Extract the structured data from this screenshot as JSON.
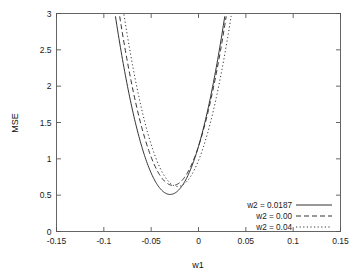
{
  "chart_data": {
    "type": "line",
    "title": "",
    "xlabel": "w1",
    "ylabel": "MSE",
    "xlim": [
      -0.15,
      0.15
    ],
    "ylim": [
      0,
      3
    ],
    "grid": false,
    "legend_position": "lower-right",
    "xticks": [
      "-0.15",
      "-0.1",
      "-0.05",
      "0",
      "0.05",
      "0.1",
      "0.15"
    ],
    "xtick_values": [
      -0.15,
      -0.1,
      -0.05,
      0,
      0.05,
      0.1,
      0.15
    ],
    "yticks": [
      "0",
      "0.5",
      "1",
      "1.5",
      "2",
      "2.5",
      "3"
    ],
    "ytick_values": [
      0,
      0.5,
      1,
      1.5,
      2,
      2.5,
      3
    ],
    "series": [
      {
        "name": "w2 = 0.0187",
        "style": "solid",
        "vertex_x": -0.03,
        "vertex_y": 0.51,
        "curvature": 735,
        "x": [
          -0.122,
          -0.11,
          -0.1,
          -0.09,
          -0.08,
          -0.07,
          -0.06,
          -0.05,
          -0.04,
          -0.03,
          -0.02,
          -0.01,
          0.0,
          0.01,
          0.02,
          0.03,
          0.04,
          0.05,
          0.058
        ],
        "y": [
          3.0,
          2.49,
          2.1,
          1.76,
          1.47,
          1.22,
          1.02,
          0.86,
          0.75,
          0.51,
          0.59,
          0.81,
          1.17,
          1.49,
          1.86,
          2.28,
          2.75,
          3.0,
          3.0
        ]
      },
      {
        "name": "w2 = 0.00",
        "style": "dashed",
        "vertex_x": -0.027,
        "vertex_y": 0.635,
        "curvature": 735,
        "x": [
          -0.118,
          -0.11,
          -0.1,
          -0.09,
          -0.08,
          -0.07,
          -0.06,
          -0.05,
          -0.04,
          -0.03,
          -0.02,
          -0.01,
          0.0,
          0.01,
          0.02,
          0.03,
          0.04,
          0.05,
          0.062
        ],
        "y": [
          3.0,
          2.67,
          2.26,
          1.91,
          1.6,
          1.34,
          1.13,
          0.96,
          0.84,
          0.64,
          0.69,
          0.89,
          1.24,
          1.55,
          1.9,
          2.31,
          2.76,
          3.0,
          3.0
        ]
      },
      {
        "name": "w2 = 0.04",
        "style": "dotted",
        "vertex_x": -0.022,
        "vertex_y": 0.62,
        "curvature": 735,
        "x": [
          -0.112,
          -0.1,
          -0.09,
          -0.08,
          -0.07,
          -0.06,
          -0.05,
          -0.04,
          -0.03,
          -0.02,
          -0.01,
          0.0,
          0.01,
          0.02,
          0.03,
          0.04,
          0.05,
          0.06,
          0.068
        ],
        "y": [
          3.0,
          2.52,
          2.16,
          1.83,
          1.54,
          1.28,
          1.06,
          0.88,
          0.73,
          0.62,
          0.72,
          0.99,
          1.33,
          1.71,
          2.11,
          2.56,
          3.0,
          3.0,
          3.0
        ]
      }
    ],
    "legend": [
      {
        "label": "w2 = 0.0187",
        "style": "solid"
      },
      {
        "label": "w2 = 0.00",
        "style": "dashed"
      },
      {
        "label": "w2 = 0.04",
        "style": "dotted"
      }
    ]
  }
}
